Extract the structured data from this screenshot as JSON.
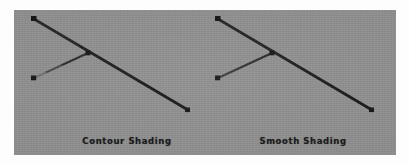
{
  "figure": {
    "panel_background": "#8e8e8e",
    "page_background": "#ffffff",
    "width": 409,
    "height": 163
  },
  "panels": [
    {
      "id": "contour-shading",
      "caption": "Contour Shading",
      "description": "Wireframe rendering with banded contour shading showing discrete brightness steps along each edge",
      "shading_mode": "contour",
      "geometry": {
        "vertices": [
          {
            "name": "top-left",
            "x": 34,
            "y": 19
          },
          {
            "name": "center",
            "x": 88,
            "y": 53
          },
          {
            "name": "lower-left",
            "x": 34,
            "y": 78
          },
          {
            "name": "right-end",
            "x": 188,
            "y": 110
          },
          {
            "name": "stem-bottom",
            "x": 34,
            "y": 145
          }
        ],
        "edges": [
          {
            "name": "vertical-left",
            "from": "top-left",
            "to": "lower-left"
          },
          {
            "name": "upper-diagonal",
            "from": "top-left",
            "to": "right-end"
          },
          {
            "name": "lower-diagonal",
            "from": "lower-left",
            "to": "center"
          },
          {
            "name": "stem",
            "from": "lower-left",
            "to": "stem-bottom"
          }
        ]
      },
      "line_color": "#1c1c1c",
      "band_count": 4
    },
    {
      "id": "smooth-shading",
      "caption": "Smooth Shading",
      "description": "Wireframe rendering with smooth gouraud shading producing continuous brightness gradients along each edge",
      "shading_mode": "smooth",
      "geometry": {
        "vertices": [
          {
            "name": "top-left",
            "x": 218,
            "y": 19
          },
          {
            "name": "center",
            "x": 272,
            "y": 53
          },
          {
            "name": "lower-left",
            "x": 218,
            "y": 78
          },
          {
            "name": "right-end",
            "x": 372,
            "y": 110
          },
          {
            "name": "stem-bottom",
            "x": 218,
            "y": 145
          }
        ],
        "edges": [
          {
            "name": "vertical-left",
            "from": "top-left",
            "to": "lower-left"
          },
          {
            "name": "upper-diagonal",
            "from": "top-left",
            "to": "right-end"
          },
          {
            "name": "lower-diagonal",
            "from": "lower-left",
            "to": "center"
          },
          {
            "name": "stem",
            "from": "lower-left",
            "to": "stem-bottom"
          }
        ]
      },
      "line_color": "#1c1c1c",
      "band_count": 0
    }
  ]
}
